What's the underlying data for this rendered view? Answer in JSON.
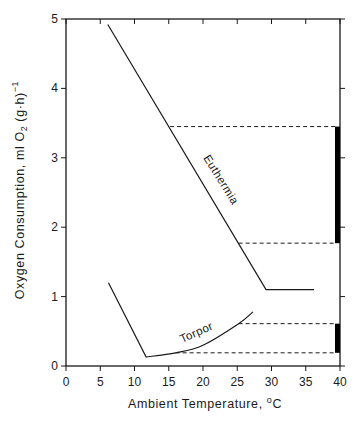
{
  "chart_data": {
    "type": "line",
    "title": "",
    "xlabel": "Ambient Temperature, °C",
    "xlabel_parts": {
      "text": "Ambient Temperature, ",
      "degree": "o",
      "unit": "C"
    },
    "ylabel": "Oxygen Consumption, ml O2 (g·h)^-1",
    "ylabel_parts": {
      "main": "Oxygen Consumption, ml O",
      "sub": "2",
      "rest": " (g·h)",
      "sup": "−1"
    },
    "xlim": [
      0,
      40
    ],
    "ylim": [
      0,
      5
    ],
    "x_ticks": [
      0,
      5,
      10,
      15,
      20,
      25,
      30,
      35,
      40
    ],
    "y_ticks": [
      0,
      1,
      2,
      3,
      4,
      5
    ],
    "grid": false,
    "legend": "none (inline labels)",
    "series": [
      {
        "name": "Euthermia",
        "style": "solid",
        "points": [
          [
            6.1,
            4.92
          ],
          [
            29.2,
            1.1
          ],
          [
            36.2,
            1.1
          ]
        ]
      },
      {
        "name": "Torpor",
        "style": "solid",
        "points": [
          [
            6.2,
            1.2
          ],
          [
            11.7,
            0.13
          ],
          [
            16.0,
            0.19
          ],
          [
            20.0,
            0.3
          ],
          [
            25.2,
            0.61
          ],
          [
            27.3,
            0.78
          ]
        ]
      }
    ],
    "reference_lines": [
      {
        "style": "dashed",
        "y": 3.45,
        "x_from": 15.2,
        "x_to": 39.5
      },
      {
        "style": "dashed",
        "y": 1.77,
        "x_from": 25.2,
        "x_to": 39.5
      },
      {
        "style": "dashed",
        "y": 0.61,
        "x_from": 25.2,
        "x_to": 39.5
      },
      {
        "style": "dashed",
        "y": 0.19,
        "x_from": 16.0,
        "x_to": 39.5
      }
    ],
    "range_bars": [
      {
        "x": 39.7,
        "y_from": 1.77,
        "y_to": 3.45,
        "label": "Euthermia range 15–25 °C"
      },
      {
        "x": 39.7,
        "y_from": 0.19,
        "y_to": 0.61,
        "label": "Torpor range 16–25 °C"
      }
    ],
    "annotations": [
      {
        "text": "Euthermia",
        "near": [
          22,
          2.6
        ],
        "rotation_deg": 58
      },
      {
        "text": "Torpor",
        "near": [
          19,
          0.4
        ],
        "rotation_deg": -24
      }
    ]
  },
  "labels": {
    "euthermia": "Euthermia",
    "torpor": "Torpor"
  }
}
